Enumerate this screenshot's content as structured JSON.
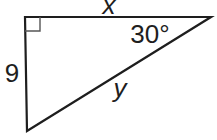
{
  "diagram": {
    "type": "right-triangle",
    "labels": {
      "top_side": "x",
      "angle": "30°",
      "left_side": "9",
      "hypotenuse": "y"
    },
    "colors": {
      "line": "#1e1e1e",
      "marker": "#555555",
      "background": "#ffffff"
    }
  }
}
